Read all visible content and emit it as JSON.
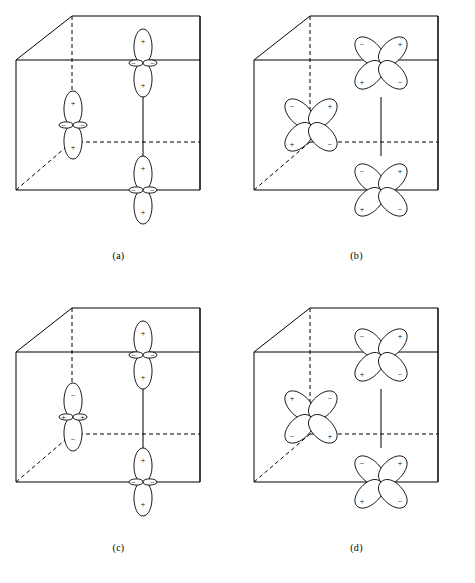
{
  "figure": {
    "background_color": "#ffffff",
    "line_color": "#000000",
    "panel_count": 4
  },
  "panels": [
    {
      "id": "a",
      "caption": "(a)",
      "orbital_type": "dz2",
      "description": "Two-lobed axial orbitals, all sites in phase",
      "sites": [
        {
          "name": "upper-right",
          "cx": 143,
          "cy": 63,
          "top_sign": "+",
          "bottom_sign": "+",
          "left_sign": "−",
          "right_sign": "−"
        },
        {
          "name": "middle-left",
          "cx": 73,
          "cy": 125,
          "top_sign": "+",
          "bottom_sign": "+",
          "left_sign": "−",
          "right_sign": "−"
        },
        {
          "name": "lower-right",
          "cx": 143,
          "cy": 190,
          "top_sign": "+",
          "bottom_sign": "+",
          "left_sign": "−",
          "right_sign": "−"
        }
      ]
    },
    {
      "id": "b",
      "caption": "(b)",
      "orbital_type": "dxy",
      "description": "Four-lobed cloverleaf orbitals, all sites in phase",
      "sites": [
        {
          "name": "upper-right",
          "cx": 143,
          "cy": 63,
          "tl_sign": "−",
          "tr_sign": "+",
          "bl_sign": "+",
          "br_sign": "−"
        },
        {
          "name": "middle-left",
          "cx": 73,
          "cy": 125,
          "tl_sign": "−",
          "tr_sign": "+",
          "bl_sign": "+",
          "br_sign": "−"
        },
        {
          "name": "lower-right",
          "cx": 143,
          "cy": 190,
          "tl_sign": "−",
          "tr_sign": "+",
          "bl_sign": "+",
          "br_sign": "−"
        }
      ]
    },
    {
      "id": "c",
      "caption": "(c)",
      "orbital_type": "dz2",
      "description": "Two-lobed axial orbitals, middle-left site phase inverted",
      "sites": [
        {
          "name": "upper-right",
          "cx": 143,
          "cy": 63,
          "top_sign": "+",
          "bottom_sign": "+",
          "left_sign": "−",
          "right_sign": "−"
        },
        {
          "name": "middle-left",
          "cx": 73,
          "cy": 125,
          "top_sign": "−",
          "bottom_sign": "−",
          "left_sign": "+",
          "right_sign": "+"
        },
        {
          "name": "lower-right",
          "cx": 143,
          "cy": 190,
          "top_sign": "+",
          "bottom_sign": "+",
          "left_sign": "−",
          "right_sign": "−"
        }
      ]
    },
    {
      "id": "d",
      "caption": "(d)",
      "orbital_type": "dxy",
      "description": "Four-lobed cloverleaf orbitals, middle-left site phase inverted",
      "sites": [
        {
          "name": "upper-right",
          "cx": 143,
          "cy": 63,
          "tl_sign": "−",
          "tr_sign": "+",
          "bl_sign": "+",
          "br_sign": "−"
        },
        {
          "name": "middle-left",
          "cx": 73,
          "cy": 125,
          "tl_sign": "+",
          "tr_sign": "−",
          "bl_sign": "−",
          "br_sign": "+"
        },
        {
          "name": "lower-right",
          "cx": 143,
          "cy": 190,
          "tl_sign": "−",
          "tr_sign": "+",
          "bl_sign": "+",
          "br_sign": "−"
        }
      ]
    }
  ],
  "cube": {
    "front_top_left": [
      16,
      60
    ],
    "front_top_right": [
      200,
      60
    ],
    "front_bottom_left": [
      16,
      190
    ],
    "front_bottom_right": [
      200,
      190
    ],
    "back_top_left": [
      72,
      16
    ],
    "back_top_right": [
      200,
      16
    ],
    "back_bottom_left": [
      72,
      142
    ],
    "back_bottom_right": [
      200,
      142
    ]
  },
  "panel_positions": [
    {
      "id": "a",
      "left": 0,
      "top": 0,
      "caption_top": 250
    },
    {
      "id": "b",
      "left": 238,
      "top": 0,
      "caption_top": 250
    },
    {
      "id": "c",
      "left": 0,
      "top": 292,
      "caption_top": 250
    },
    {
      "id": "d",
      "left": 238,
      "top": 292,
      "caption_top": 250
    }
  ]
}
